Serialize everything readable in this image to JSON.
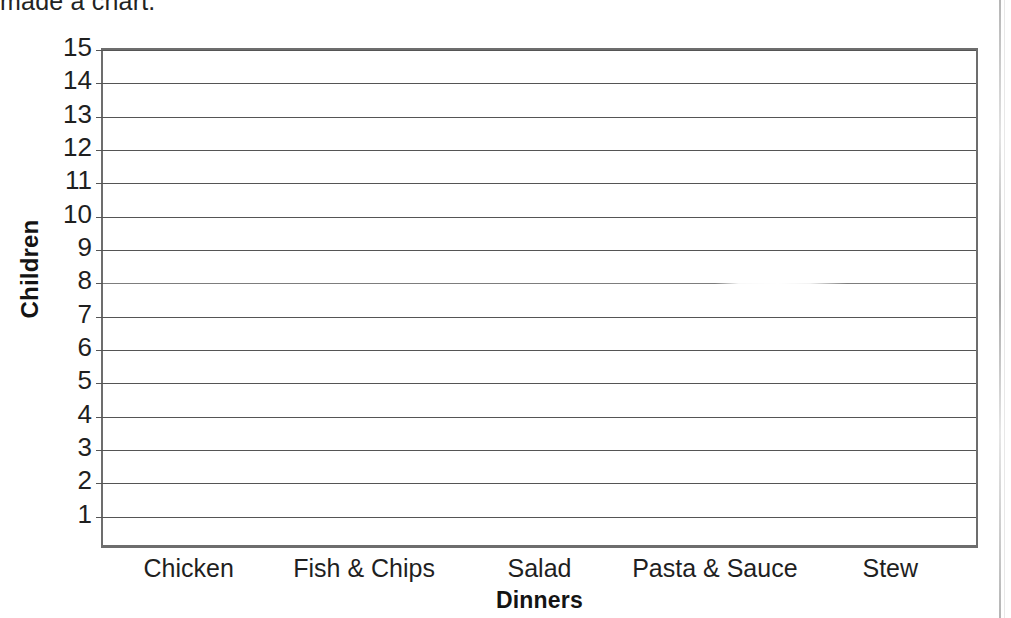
{
  "document": {
    "clipped_sentence": "made a chart.",
    "background_color": "#ffffff",
    "ink_color": "#1f1f1f",
    "gridline_color": "#555555",
    "axis_color": "#6d6d6d"
  },
  "chart_data": {
    "type": "bar",
    "title": "",
    "subtitle": "",
    "xlabel": "Dinners",
    "ylabel": "Children",
    "categories": [
      "Chicken",
      "Fish & Chips",
      "Salad",
      "Pasta & Sauce",
      "Stew"
    ],
    "values": [
      0,
      0,
      0,
      0,
      0
    ],
    "series": [
      {
        "name": "Children",
        "values": [
          0,
          0,
          0,
          0,
          0
        ]
      }
    ],
    "ylim": [
      0,
      15
    ],
    "ytick_step": 1,
    "yticks": [
      15,
      14,
      13,
      12,
      11,
      10,
      9,
      8,
      7,
      6,
      5,
      4,
      3,
      2,
      1
    ],
    "ytick_labels": [
      "15",
      "14",
      "13",
      "12",
      "11",
      "10",
      "9",
      "8",
      "7",
      "6",
      "5",
      "4",
      "3",
      "2",
      "1"
    ],
    "grid": true,
    "grid_axis": "y",
    "legend": false,
    "legend_position": "none",
    "annotations": [],
    "note": "Blank worksheet chart — axes and gridlines drawn, no bars plotted"
  },
  "axes": {
    "y_axis": {
      "label": "Children",
      "label_bold": true,
      "label_rotation": -90,
      "max": 15,
      "min": 0
    },
    "x_axis": {
      "label": "Dinners",
      "label_bold": true,
      "tick_labels": [
        "Chicken",
        "Fish & Chips",
        "Salad",
        "Pasta & Sauce",
        "Stew"
      ]
    }
  }
}
